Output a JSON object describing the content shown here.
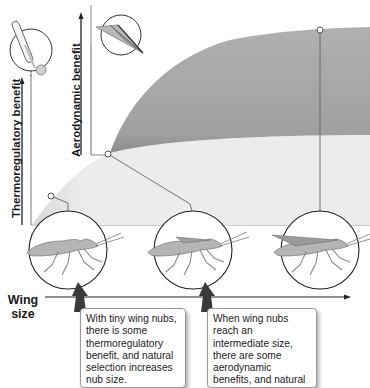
{
  "diagram": {
    "y_axes": {
      "thermoregulatory": {
        "label": "Thermoregulatory benefit",
        "icon": "thermometer-icon"
      },
      "aerodynamic": {
        "label": "Aerodynamic benefit",
        "icon": "paper-airplane-icon"
      }
    },
    "x_axis": {
      "label_line1": "Wing",
      "label_line2": "size"
    },
    "regions": [
      {
        "name": "thermoregulatory-benefit-area",
        "color": "#e8e8e8"
      },
      {
        "name": "aerodynamic-benefit-area",
        "color": "#a9a9a9"
      }
    ],
    "insects": [
      {
        "stage": "tiny wing nubs",
        "wing": "none"
      },
      {
        "stage": "intermediate wing nubs",
        "wing": "small"
      },
      {
        "stage": "full wings",
        "wing": "large"
      }
    ],
    "callouts": [
      {
        "text": "With tiny wing nubs, there is some thermoregulatory benefit, and natural selection increases nub size."
      },
      {
        "text": "When wing nubs reach an intermediate size, there are some aerodynamic benefits, and natural selection increases size further."
      }
    ]
  }
}
